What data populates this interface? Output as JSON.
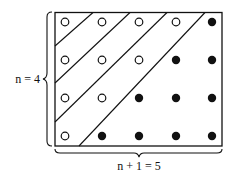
{
  "diagram": {
    "title": "",
    "rows": 4,
    "cols": 5,
    "labels": {
      "left": "n = 4",
      "bottom": "n + 1 = 5"
    },
    "grid": [
      [
        "open",
        "open",
        "open",
        "open",
        "filled"
      ],
      [
        "open",
        "open",
        "open",
        "filled",
        "filled"
      ],
      [
        "open",
        "open",
        "filled",
        "filled",
        "filled"
      ],
      [
        "open",
        "filled",
        "filled",
        "filled",
        "filled"
      ]
    ],
    "counts": {
      "open": 10,
      "filled": 10
    },
    "colors": {
      "stroke": "#111111",
      "background": "#ffffff"
    }
  }
}
